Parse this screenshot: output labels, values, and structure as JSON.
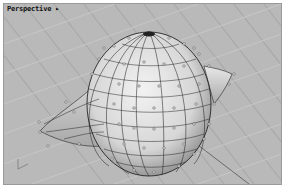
{
  "viewport": {
    "title": "Perspective",
    "title_arrow": "▸",
    "background_color": "#b9b9b9",
    "grid_line_color": "#a8a8a8",
    "wire_color": "#1a1a1a",
    "surface_color": "#e6e6e6",
    "control_point_color": "#ffffff"
  }
}
